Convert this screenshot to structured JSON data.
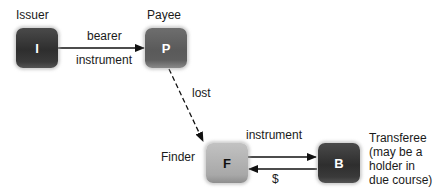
{
  "diagram": {
    "type": "flow",
    "nodes": [
      {
        "id": "I",
        "glyph": "I",
        "label": "Issuer",
        "shade": "dark"
      },
      {
        "id": "P",
        "glyph": "P",
        "label": "Payee",
        "shade": "mid"
      },
      {
        "id": "F",
        "glyph": "F",
        "label": "Finder",
        "shade": "light"
      },
      {
        "id": "B",
        "glyph": "B",
        "label_lines": [
          "Transferee",
          "(may be a",
          "holder in",
          "due course)"
        ],
        "shade": "dark"
      }
    ],
    "edges": [
      {
        "from": "I",
        "to": "P",
        "label_top": "bearer",
        "label_bottom": "instrument",
        "style": "solid"
      },
      {
        "from": "P",
        "to": "F",
        "label": "lost",
        "style": "dashed"
      },
      {
        "from": "F",
        "to": "B",
        "label": "instrument",
        "style": "solid"
      },
      {
        "from": "B",
        "to": "F",
        "label": "$",
        "style": "solid"
      }
    ]
  }
}
